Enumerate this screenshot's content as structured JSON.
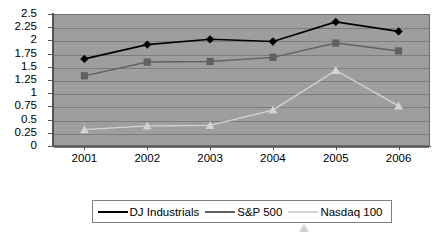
{
  "chart_data": {
    "type": "line",
    "title": "",
    "subtitle": "",
    "xlabel": "",
    "ylabel": "",
    "categories": [
      "2001",
      "2002",
      "2003",
      "2004",
      "2005",
      "2006"
    ],
    "ylim": [
      0,
      2.5
    ],
    "ytick_labels": [
      "2.5",
      "2.25",
      "2",
      "1.75",
      "1.5",
      "1.25",
      "1",
      "0.75",
      "0.5",
      "0.25",
      "0"
    ],
    "ytick_values": [
      2.5,
      2.25,
      2,
      1.75,
      1.5,
      1.25,
      1,
      0.75,
      0.5,
      0.25,
      0
    ],
    "grid": true,
    "grid_axis": "y",
    "legend_position": "bottom",
    "plot_background": "#9e9e9e",
    "series": [
      {
        "name": "DJ Industrials",
        "color": "#000000",
        "marker": "diamond",
        "values": [
          1.65,
          1.92,
          2.02,
          1.98,
          2.35,
          2.17
        ]
      },
      {
        "name": "S&P 500",
        "color": "#606060",
        "marker": "square",
        "values": [
          1.33,
          1.59,
          1.6,
          1.68,
          1.95,
          1.8
        ]
      },
      {
        "name": "Nasdaq 100",
        "color": "#d4d4d4",
        "marker": "triangle",
        "values": [
          0.31,
          0.38,
          0.39,
          0.68,
          1.43,
          0.76
        ]
      }
    ]
  },
  "legend": {
    "items": [
      {
        "label": "DJ Industrials"
      },
      {
        "label": "S&P 500"
      },
      {
        "label": "Nasdaq 100"
      }
    ]
  }
}
